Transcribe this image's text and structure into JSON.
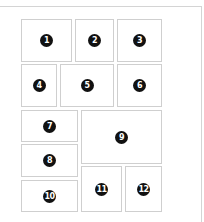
{
  "diagram": {
    "colors": {
      "border": "#cfcfcf",
      "badge": "#111111",
      "badge_text": "#ffffff",
      "background": "#ffffff"
    },
    "boxes": [
      {
        "label": "1",
        "x": 21,
        "y": 19,
        "w": 51,
        "h": 43
      },
      {
        "label": "2",
        "x": 75,
        "y": 19,
        "w": 39,
        "h": 43
      },
      {
        "label": "3",
        "x": 117,
        "y": 19,
        "w": 45,
        "h": 43
      },
      {
        "label": "4",
        "x": 21,
        "y": 64,
        "w": 36,
        "h": 43
      },
      {
        "label": "5",
        "x": 60,
        "y": 64,
        "w": 54,
        "h": 43
      },
      {
        "label": "6",
        "x": 117,
        "y": 64,
        "w": 45,
        "h": 43
      },
      {
        "label": "7",
        "x": 21,
        "y": 110,
        "w": 57,
        "h": 32
      },
      {
        "label": "8",
        "x": 21,
        "y": 144,
        "w": 57,
        "h": 33
      },
      {
        "label": "9",
        "x": 81,
        "y": 110,
        "w": 81,
        "h": 54
      },
      {
        "label": "10",
        "x": 21,
        "y": 180,
        "w": 57,
        "h": 32
      },
      {
        "label": "11",
        "x": 81,
        "y": 166,
        "w": 41,
        "h": 46
      },
      {
        "label": "12",
        "x": 125,
        "y": 166,
        "w": 37,
        "h": 46
      }
    ]
  }
}
